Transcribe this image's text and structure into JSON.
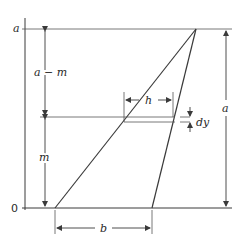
{
  "diagram": {
    "labels": {
      "axis_top": "a",
      "axis_origin": "0",
      "a_minus_m": "a − m",
      "m": "m",
      "h": "h",
      "dy": "dy",
      "right_a": "a",
      "b": "b"
    },
    "geometry": {
      "axis_x": 25,
      "top_y": 29,
      "base_y": 208,
      "apex": [
        196,
        29
      ],
      "base_left": [
        55,
        208
      ],
      "base_right": [
        152,
        208
      ],
      "strip_top_y": 117,
      "strip_bottom_y": 122,
      "h_dim_y": 100,
      "h_left_x": 124,
      "h_right_x": 173,
      "right_dim_x": 226,
      "b_dim_y": 228,
      "inner_dim_x": 45
    },
    "colors": {
      "line": "#3a3a3a",
      "text": "#2a2a2a",
      "background": "#ffffff"
    }
  }
}
